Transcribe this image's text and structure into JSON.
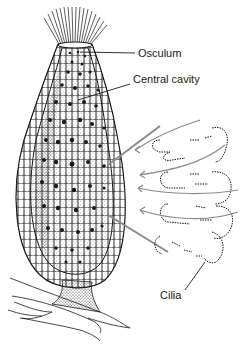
{
  "labels": {
    "osculum": "Osculum",
    "central_cavity": "Central cavity",
    "cilia": "Cilia"
  },
  "colors": {
    "ink": "#1a1a1a",
    "flow_arrows": "#8a8a8a",
    "background": "#ffffff"
  }
}
